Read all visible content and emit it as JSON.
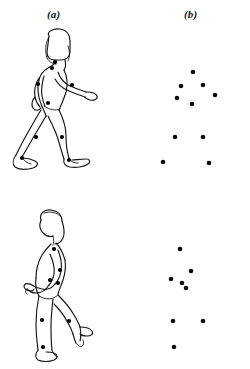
{
  "figure": {
    "background_color": "#ffffff",
    "ink_color": "#15151a",
    "dot_color": "#000000",
    "panel_labels": {
      "left": "(a)",
      "right": "(b)"
    },
    "caption_partial": ""
  },
  "chart_data": {
    "type": "scatter",
    "title": "",
    "xlabel": "",
    "ylabel": "",
    "grid": false,
    "legend": null,
    "panels": [
      {
        "name": "walking-figure-outline",
        "label": "(a)",
        "row": "top",
        "description": "Outline drawing of a walking person in side view with filled joint markers",
        "xlim": [
          0,
          124
        ],
        "ylim": [
          0,
          160
        ],
        "points": [
          {
            "name": "head",
            "x": 47,
            "y": 36
          },
          {
            "name": "shoulder",
            "x": 44,
            "y": 42
          },
          {
            "name": "elbow-far",
            "x": 30,
            "y": 58
          },
          {
            "name": "elbow-near",
            "x": 64,
            "y": 59
          },
          {
            "name": "hip",
            "x": 40,
            "y": 77
          },
          {
            "name": "knee-rear",
            "x": 28,
            "y": 111
          },
          {
            "name": "knee-front",
            "x": 54,
            "y": 111
          },
          {
            "name": "ankle-rear",
            "x": 14,
            "y": 132
          },
          {
            "name": "ankle-front",
            "x": 61,
            "y": 134
          }
        ]
      },
      {
        "name": "walking-point-light-display",
        "label": "(b)",
        "row": "top",
        "description": "Point-light display of the walking figure: ten isolated dots at the joints",
        "xlim": [
          0,
          112
        ],
        "ylim": [
          0,
          160
        ],
        "points": [
          {
            "name": "head",
            "x": 59,
            "y": 46
          },
          {
            "name": "shoulder",
            "x": 47,
            "y": 60
          },
          {
            "name": "elbow-near",
            "x": 69,
            "y": 59
          },
          {
            "name": "elbow-far",
            "x": 43,
            "y": 72
          },
          {
            "name": "wrist-far",
            "x": 81,
            "y": 69
          },
          {
            "name": "hip",
            "x": 58,
            "y": 78
          },
          {
            "name": "knee-rear",
            "x": 41,
            "y": 111
          },
          {
            "name": "knee-front",
            "x": 69,
            "y": 111
          },
          {
            "name": "ankle-rear",
            "x": 29,
            "y": 136
          },
          {
            "name": "ankle-front",
            "x": 75,
            "y": 137
          }
        ]
      },
      {
        "name": "kneeling-figure-outline",
        "label": "(a)",
        "row": "bottom",
        "description": "Outline drawing of a person in a lunging or kneeling posture with filled joint markers",
        "xlim": [
          0,
          124
        ],
        "ylim": [
          0,
          166
        ],
        "points": [
          {
            "name": "shoulder",
            "x": 46,
            "y": 49
          },
          {
            "name": "elbow",
            "x": 52,
            "y": 70
          },
          {
            "name": "wrist",
            "x": 42,
            "y": 80
          },
          {
            "name": "hip",
            "x": 50,
            "y": 83
          },
          {
            "name": "knee-rear",
            "x": 34,
            "y": 120
          },
          {
            "name": "knee-front",
            "x": 61,
            "y": 121
          },
          {
            "name": "ankle-rear",
            "x": 35,
            "y": 147
          }
        ]
      },
      {
        "name": "kneeling-point-light-display",
        "label": "(b)",
        "row": "bottom",
        "description": "Point-light display of the kneeling figure: eight isolated dots at the joints",
        "xlim": [
          0,
          112
        ],
        "ylim": [
          0,
          166
        ],
        "points": [
          {
            "name": "head",
            "x": 46,
            "y": 49
          },
          {
            "name": "shoulder",
            "x": 57,
            "y": 71
          },
          {
            "name": "elbow",
            "x": 37,
            "y": 79
          },
          {
            "name": "wrist",
            "x": 48,
            "y": 83
          },
          {
            "name": "hip",
            "x": 52,
            "y": 88
          },
          {
            "name": "knee-rear",
            "x": 39,
            "y": 121
          },
          {
            "name": "knee-front",
            "x": 69,
            "y": 121
          },
          {
            "name": "ankle-rear",
            "x": 40,
            "y": 147
          }
        ]
      }
    ]
  }
}
